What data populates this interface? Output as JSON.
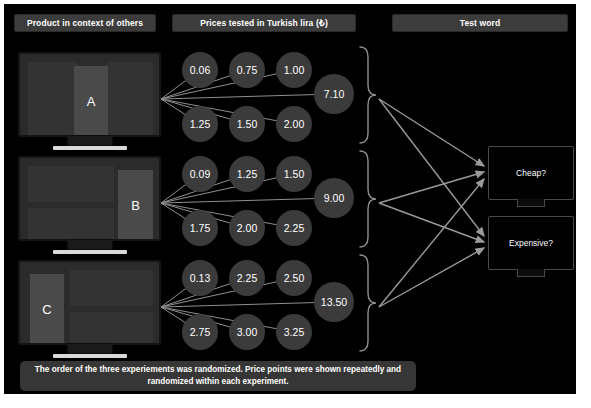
{
  "headers": {
    "product": "Product in context of others",
    "prices": "Prices tested in Turkish lira (₺)",
    "testword": "Test word"
  },
  "products": [
    {
      "id": "A",
      "label": "A",
      "position": "center"
    },
    {
      "id": "B",
      "label": "B",
      "position": "right"
    },
    {
      "id": "C",
      "label": "C",
      "position": "left"
    }
  ],
  "price_blocks": [
    {
      "product": "A",
      "top_row": [
        "0.06",
        "0.75",
        "1.00"
      ],
      "highlight": "7.10",
      "bottom_row": [
        "1.25",
        "1.50",
        "2.00"
      ]
    },
    {
      "product": "B",
      "top_row": [
        "0.09",
        "1.25",
        "1.50"
      ],
      "highlight": "9.00",
      "bottom_row": [
        "1.75",
        "2.00",
        "2.25"
      ]
    },
    {
      "product": "C",
      "top_row": [
        "0.13",
        "2.25",
        "2.50"
      ],
      "highlight": "13.50",
      "bottom_row": [
        "2.75",
        "3.00",
        "3.25"
      ]
    }
  ],
  "test_words": [
    {
      "id": "cheap",
      "label": "Cheap?"
    },
    {
      "id": "expensive",
      "label": "Expensive?"
    }
  ],
  "caption": "The order of the three experiements was randomized. Price points were shown repeatedly and randomized within each experiment.",
  "colors": {
    "background": "#000000",
    "header_bar": "#3c3c3c",
    "circle": "#3b3b3b",
    "monitor_screen": "#2b2b2b",
    "product_highlight": "#4a4a4a",
    "caption_bar": "#363636",
    "wire": "#8a8a8a",
    "text": "#ffffff"
  }
}
